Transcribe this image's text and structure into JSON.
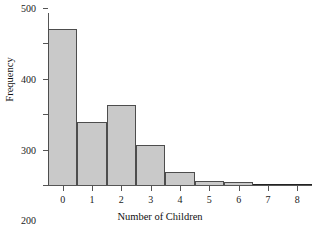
{
  "chart_data": {
    "type": "bar",
    "title": "",
    "subtitle": "",
    "xlabel": "Number of Children",
    "ylabel": "Frequency",
    "categories": [
      "0",
      "1",
      "2",
      "3",
      "4",
      "5",
      "6",
      "7",
      "8"
    ],
    "values": [
      440,
      177,
      227,
      113,
      38,
      10,
      9,
      0,
      3
    ],
    "xlim": [
      -0.5,
      8.5
    ],
    "ylim": [
      0,
      500
    ],
    "yticks": [
      0,
      100,
      200,
      300,
      400,
      500
    ],
    "ytick_labels": [
      "0",
      "100",
      "200",
      "300",
      "400",
      "500"
    ],
    "xticks": [
      0,
      1,
      2,
      3,
      4,
      5,
      6,
      7,
      8
    ],
    "xtick_labels": [
      "0",
      "1",
      "2",
      "3",
      "4",
      "5",
      "6",
      "7",
      "8"
    ],
    "grid": false,
    "legend": null,
    "bar_fill_color": "#c9c9c9",
    "bar_edge_color": "#4d4d4d",
    "axis_color": "#555555",
    "background_color": "#ffffff",
    "bin_width": 1
  }
}
